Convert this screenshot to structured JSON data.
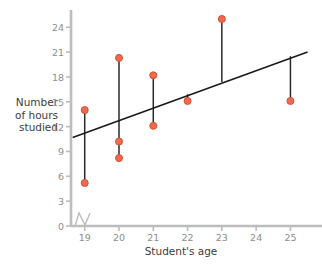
{
  "chart_data": {
    "type": "scatter",
    "title": "",
    "subtitle": "",
    "xlabel": "Student's age",
    "ylabel": "Number of hours studied",
    "ylabel_lines": [
      "Number",
      "of hours",
      "studied"
    ],
    "xlim": [
      18.6,
      25.6
    ],
    "ylim": [
      0,
      25.6
    ],
    "xticks": [
      19,
      20,
      21,
      22,
      23,
      24,
      25
    ],
    "xtick_labels": [
      "19",
      "20",
      "21",
      "22",
      "23",
      "24",
      "25"
    ],
    "yticks": [
      0,
      3,
      6,
      9,
      12,
      15,
      18,
      21,
      24
    ],
    "ytick_labels": [
      "0",
      "3",
      "6",
      "9",
      "12",
      "15",
      "18",
      "21",
      "24"
    ],
    "grid": false,
    "legend": null,
    "axis_break": true,
    "points": [
      {
        "x": 19,
        "y": 14.0
      },
      {
        "x": 19,
        "y": 5.2
      },
      {
        "x": 20,
        "y": 20.3
      },
      {
        "x": 20,
        "y": 10.2
      },
      {
        "x": 20,
        "y": 8.2
      },
      {
        "x": 21,
        "y": 18.2
      },
      {
        "x": 21,
        "y": 12.1
      },
      {
        "x": 22,
        "y": 15.1
      },
      {
        "x": 23,
        "y": 25.0
      },
      {
        "x": 25,
        "y": 15.1
      }
    ],
    "residual_segments": [
      {
        "x": 19,
        "y1": 14.0,
        "y2": 5.2
      },
      {
        "x": 20,
        "y1": 20.3,
        "y2": 8.2
      },
      {
        "x": 21,
        "y1": 18.2,
        "y2": 12.1
      },
      {
        "x": 22,
        "y1": 15.9,
        "y2": 15.1
      },
      {
        "x": 23,
        "y1": 25.0,
        "y2": 17.4
      },
      {
        "x": 25,
        "y1": 20.5,
        "y2": 15.1
      }
    ],
    "trend_line": {
      "type": "line",
      "x1": 18.65,
      "y1": 10.7,
      "x2": 25.5,
      "y2": 21.0,
      "slope": 1.5,
      "intercept": -17.3
    },
    "colors": {
      "point_fill": "#ee6b4d",
      "point_stroke": "#d4502f",
      "trend_line": "#1a1a1a",
      "residual_line": "#2a2a2a",
      "axis": "#bdbdbd",
      "tick_label": "#8d8d8d",
      "axis_title": "#3d3d3d",
      "background": "#ffffff"
    }
  }
}
